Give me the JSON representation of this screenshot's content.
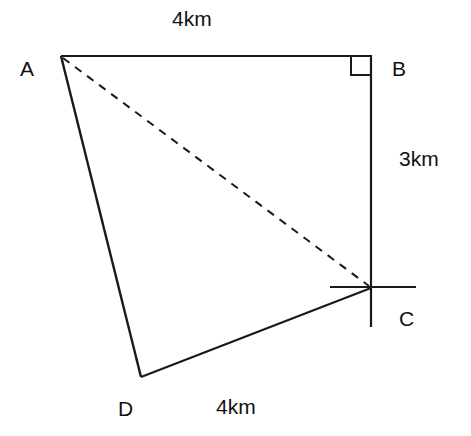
{
  "diagram": {
    "points": {
      "A": {
        "label": "A"
      },
      "B": {
        "label": "B"
      },
      "C": {
        "label": "C"
      },
      "D": {
        "label": "D"
      }
    },
    "edges": {
      "AB": {
        "length": "4km"
      },
      "BC": {
        "length": "3km"
      },
      "CD": {
        "length": "4km"
      }
    },
    "line_color": "#1a1a1a"
  }
}
